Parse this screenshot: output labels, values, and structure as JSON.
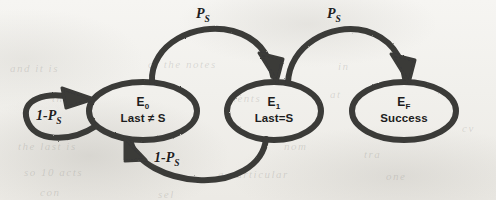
{
  "diagram": {
    "stroke_color": "#3a3a38",
    "text_color": "#1d1d1d",
    "background_color": "#f3f2ef",
    "states": [
      {
        "id": "E0",
        "label_top": "E",
        "label_sub": "0",
        "label_bottom": "Last ≠ S",
        "cx": 143,
        "cy": 111,
        "rx": 54,
        "ry": 29
      },
      {
        "id": "E1",
        "label_top": "E",
        "label_sub": "1",
        "label_bottom": "Last=S",
        "cx": 274,
        "cy": 111,
        "rx": 47,
        "ry": 29
      },
      {
        "id": "EF",
        "label_top": "E",
        "label_sub": "F",
        "label_bottom": "Success",
        "cx": 404,
        "cy": 111,
        "rx": 52,
        "ry": 29
      }
    ],
    "transitions": [
      {
        "id": "e0-to-e1",
        "from": "E0",
        "to": "E1",
        "label": "P",
        "label_sub": "S",
        "label_x": 196,
        "label_y": 6,
        "shape": "top-arc"
      },
      {
        "id": "e1-to-ef",
        "from": "E1",
        "to": "EF",
        "label": "P",
        "label_sub": "S",
        "label_x": 327,
        "label_y": 6,
        "shape": "top-arc"
      },
      {
        "id": "e1-to-e0",
        "from": "E1",
        "to": "E0",
        "label": "1-P",
        "label_sub": "S",
        "label_x": 165,
        "label_y": 152,
        "shape": "bottom-arc"
      },
      {
        "id": "e0-self-loop",
        "from": "E0",
        "to": "E0",
        "label": "1-P",
        "label_sub": "S",
        "label_x": 40,
        "label_y": 110,
        "shape": "self-loop-left"
      }
    ]
  },
  "ghost_text": [
    {
      "text": "and it is",
      "x": 10,
      "y": 62,
      "size": 11
    },
    {
      "text": "of the notes",
      "x": 148,
      "y": 58,
      "size": 11
    },
    {
      "text": "to",
      "x": 268,
      "y": 58,
      "size": 11
    },
    {
      "text": "in",
      "x": 338,
      "y": 60,
      "size": 11
    },
    {
      "text": "the",
      "x": 52,
      "y": 92,
      "size": 11
    },
    {
      "text": "ments",
      "x": 228,
      "y": 92,
      "size": 11
    },
    {
      "text": "at",
      "x": 330,
      "y": 88,
      "size": 11
    },
    {
      "text": "cv",
      "x": 462,
      "y": 122,
      "size": 11
    },
    {
      "text": "the last is",
      "x": 18,
      "y": 140,
      "size": 11
    },
    {
      "text": "nom",
      "x": 284,
      "y": 140,
      "size": 11
    },
    {
      "text": "tra",
      "x": 364,
      "y": 148,
      "size": 11
    },
    {
      "text": "so 10 acts",
      "x": 24,
      "y": 166,
      "size": 11
    },
    {
      "text": "a particular",
      "x": 218,
      "y": 168,
      "size": 11
    },
    {
      "text": "one",
      "x": 386,
      "y": 170,
      "size": 11
    },
    {
      "text": "con",
      "x": 40,
      "y": 186,
      "size": 11
    },
    {
      "text": "sel",
      "x": 158,
      "y": 188,
      "size": 11
    }
  ]
}
